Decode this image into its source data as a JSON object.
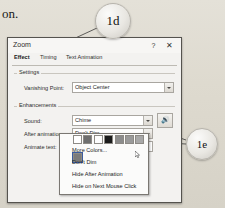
{
  "page": {
    "background_text": "on.",
    "bg_color": "#ded9cf"
  },
  "callouts": [
    {
      "id": "1d",
      "label": "1d"
    },
    {
      "id": "1e",
      "label": "1e"
    }
  ],
  "dialog": {
    "title": "Zoom",
    "titlebar_buttons": [
      {
        "name": "help",
        "glyph": "?"
      },
      {
        "name": "close",
        "glyph": "✕"
      }
    ],
    "tabs": [
      {
        "label": "Effect",
        "selected": true
      },
      {
        "label": "Timing",
        "selected": false
      },
      {
        "label": "Text Animation",
        "selected": false
      }
    ],
    "groups": [
      {
        "key": "settings",
        "label": "Settings"
      },
      {
        "key": "enhancements",
        "label": "Enhancements"
      }
    ],
    "fields": {
      "vanishing_point": {
        "label_pre": "V",
        "label_acc": "a",
        "label_post": "nishing Point:",
        "label_full": "Vanishing Point:",
        "value": "Object Center"
      },
      "sound": {
        "label_pre": "",
        "label_acc": "S",
        "label_post": "ound:",
        "label_full": "Sound:",
        "value": "Chime",
        "play_button_icon": "speaker-icon"
      },
      "after_animation": {
        "label_pre": "",
        "label_acc": "A",
        "label_post": "fter animation:",
        "label_full": "After animation:",
        "value": "Don't Dim"
      },
      "animate_text": {
        "label_pre": "A",
        "label_acc": "n",
        "label_post": "imate text:",
        "label_full": "Animate text:",
        "value": ""
      }
    },
    "dropdown_popup": {
      "swatches": [
        {
          "color": "#ffffff",
          "selected": false
        },
        {
          "color": "#6e6e6e",
          "selected": false
        },
        {
          "color": "#fdfdfd",
          "selected": false
        },
        {
          "color": "#1b1b1b",
          "selected": false
        },
        {
          "color": "#8c8c8c",
          "selected": false
        },
        {
          "color": "#9a9a9a",
          "selected": false
        },
        {
          "color": "#a8a8a8",
          "selected": false
        },
        {
          "color": "#7b7b7b",
          "selected": true
        }
      ],
      "items": [
        {
          "pre": "",
          "acc": "M",
          "post": "ore Colors...",
          "full": "More Colors..."
        },
        {
          "pre": "",
          "acc": "D",
          "post": "on't Dim",
          "full": "Don't Dim"
        },
        {
          "pre": "Hide ",
          "acc": "A",
          "post": "fter Animation",
          "full": "Hide After Animation"
        },
        {
          "pre": "",
          "acc": "H",
          "post": "ide on Next Mouse Click",
          "full": "Hide on Next Mouse Click"
        }
      ]
    },
    "buttons": [
      {
        "name": "ok",
        "label": "OK"
      },
      {
        "name": "cancel",
        "label": "Cancel"
      }
    ]
  }
}
